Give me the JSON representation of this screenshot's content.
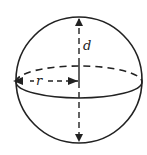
{
  "diagram": {
    "labels": {
      "diameter": "d",
      "radius": "r"
    },
    "colors": {
      "stroke": "#222222",
      "background": "#ffffff"
    }
  }
}
